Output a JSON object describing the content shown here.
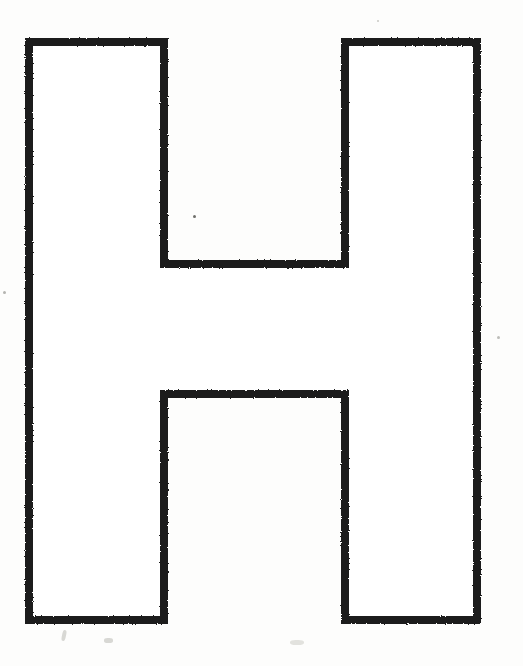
{
  "document": {
    "title": "Letter H Outline",
    "media": "scanned-line-drawing",
    "background_color": "#fdfdfc",
    "ink_color": "#1a1a1a",
    "canvas": {
      "width": 523,
      "height": 666
    }
  },
  "figure": {
    "name": "capital-letter-h",
    "label": "H",
    "style": {
      "fill": "#ffffff",
      "stroke": "#1a1a1a",
      "stroke_width": 8,
      "stroke_linejoin": "miter"
    },
    "bounds": {
      "x": 25,
      "y": 38,
      "width": 456,
      "height": 586
    },
    "geometry": {
      "outer_left": 25,
      "outer_right": 481,
      "outer_top": 38,
      "outer_bottom": 624,
      "left_stem_right": 168,
      "right_stem_left": 341,
      "crossbar_top": 268,
      "crossbar_bottom": 390,
      "stem_width": 143,
      "crossbar_height": 122
    },
    "path_points": [
      {
        "x": 29,
        "y": 42
      },
      {
        "x": 164,
        "y": 42
      },
      {
        "x": 164,
        "y": 264
      },
      {
        "x": 345,
        "y": 264
      },
      {
        "x": 345,
        "y": 42
      },
      {
        "x": 477,
        "y": 42
      },
      {
        "x": 477,
        "y": 620
      },
      {
        "x": 345,
        "y": 620
      },
      {
        "x": 345,
        "y": 394
      },
      {
        "x": 164,
        "y": 394
      },
      {
        "x": 164,
        "y": 620
      },
      {
        "x": 29,
        "y": 620
      }
    ]
  },
  "artifacts": {
    "name": "scan-artifacts",
    "specks": [
      {
        "x": 193,
        "y": 215,
        "size": 3
      },
      {
        "x": 3,
        "y": 291,
        "size": 3
      },
      {
        "x": 497,
        "y": 336,
        "size": 3
      },
      {
        "x": 377,
        "y": 20,
        "size": 2
      }
    ],
    "smudges": [
      {
        "x": 62,
        "y": 630,
        "width": 4,
        "height": 11
      },
      {
        "x": 104,
        "y": 638,
        "width": 9,
        "height": 5
      },
      {
        "x": 290,
        "y": 640,
        "width": 14,
        "height": 5
      }
    ]
  }
}
